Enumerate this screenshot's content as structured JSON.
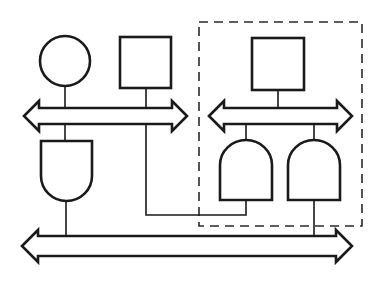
{
  "diagram": {
    "type": "block-diagram",
    "stroke_color": "#1a1a1a",
    "background": "#ffffff",
    "nodes": [
      {
        "id": "circle",
        "shape": "circle",
        "cx": 65,
        "cy": 61,
        "r": 25
      },
      {
        "id": "square-left",
        "shape": "square",
        "x": 120,
        "y": 37,
        "w": 51,
        "h": 51
      },
      {
        "id": "square-right",
        "shape": "square",
        "x": 252,
        "y": 38,
        "w": 52,
        "h": 52
      },
      {
        "id": "gate-left",
        "shape": "gate-flat-top",
        "x": 41,
        "y": 141,
        "w": 51,
        "h": 60
      },
      {
        "id": "gate-right-1",
        "shape": "gate-dome-top",
        "x": 220,
        "y": 140,
        "w": 52,
        "h": 60
      },
      {
        "id": "gate-right-2",
        "shape": "gate-dome-top",
        "x": 288,
        "y": 140,
        "w": 52,
        "h": 60
      }
    ],
    "buses": [
      {
        "id": "bus-top-left",
        "x1": 24,
        "x2": 187,
        "cy": 116
      },
      {
        "id": "bus-top-right",
        "x1": 209,
        "x2": 352,
        "cy": 116
      },
      {
        "id": "bus-bottom",
        "x1": 22,
        "x2": 352,
        "cy": 246
      }
    ],
    "group": {
      "id": "dashed-module",
      "x": 199,
      "y": 22,
      "w": 163,
      "h": 204,
      "style": "dashed"
    }
  }
}
